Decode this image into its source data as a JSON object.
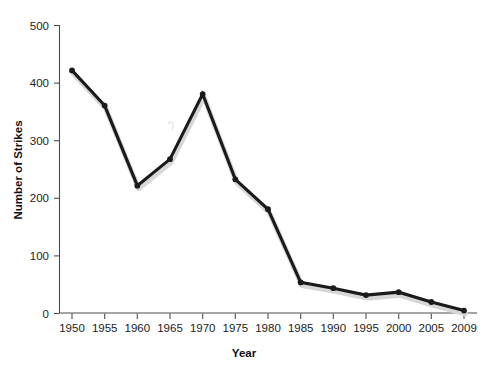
{
  "chart_data": {
    "type": "line",
    "title": "",
    "subtitle": "",
    "xlabel": "Year",
    "ylabel": "Number of Strikes",
    "x": [
      1950,
      1955,
      1960,
      1965,
      1970,
      1975,
      1980,
      1985,
      1990,
      1995,
      2000,
      2005,
      2009
    ],
    "categories": [
      "1950",
      "1955",
      "1960",
      "1965",
      "1970",
      "1975",
      "1980",
      "1985",
      "1990",
      "1995",
      "2000",
      "2005",
      "2009"
    ],
    "values": [
      422,
      361,
      222,
      268,
      381,
      233,
      181,
      54,
      44,
      32,
      37,
      20,
      5
    ],
    "series": [
      {
        "name": "Number of Strikes",
        "values": [
          422,
          361,
          222,
          268,
          381,
          233,
          181,
          54,
          44,
          32,
          37,
          20,
          5
        ],
        "color": "#1a1a1a"
      }
    ],
    "xlim": [
      1950,
      2009
    ],
    "ylim": [
      0,
      500
    ],
    "yticks": [
      0,
      100,
      200,
      300,
      400,
      500
    ],
    "ytick_labels": [
      "0",
      "100",
      "200",
      "300",
      "400",
      "500"
    ],
    "xtick_labels": [
      "1950",
      "1955",
      "1960",
      "1965",
      "1970",
      "1975",
      "1980",
      "1985",
      "1990",
      "1995",
      "2000",
      "2005",
      "2009"
    ],
    "grid": false,
    "legend": false,
    "legend_position": "none",
    "marker": "circle",
    "line_color": "#1a1a1a",
    "axis_color": "#4d4d4d",
    "background_color": "#ffffff"
  },
  "axis": {
    "x_title": "Year",
    "y_title": "Number of Strikes"
  }
}
